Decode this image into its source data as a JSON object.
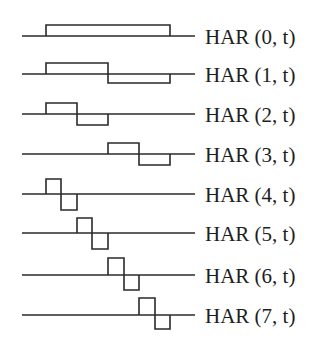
{
  "diagram": {
    "stroke_color": "#2a2a2a",
    "text_color": "#1e1e1e",
    "axis": {
      "x_start": 22,
      "x_end": 195,
      "t0": 46,
      "t1": 170
    },
    "rows": [
      {
        "label": "HAR (0, t)",
        "baseline": 36,
        "amp_up": 11,
        "amp_down": 0,
        "segments": [
          [
            46,
            170,
            1
          ]
        ]
      },
      {
        "label": "HAR (1, t)",
        "baseline": 74,
        "amp_up": 11,
        "amp_down": 9,
        "segments": [
          [
            46,
            108,
            1
          ],
          [
            108,
            170,
            -1
          ]
        ]
      },
      {
        "label": "HAR (2, t)",
        "baseline": 114,
        "amp_up": 11,
        "amp_down": 11,
        "segments": [
          [
            46,
            77,
            1
          ],
          [
            77,
            108,
            -1
          ]
        ]
      },
      {
        "label": "HAR (3, t)",
        "baseline": 154,
        "amp_up": 11,
        "amp_down": 11,
        "segments": [
          [
            108,
            139,
            1
          ],
          [
            139,
            170,
            -1
          ]
        ]
      },
      {
        "label": "HAR (4, t)",
        "baseline": 194,
        "amp_up": 15,
        "amp_down": 16,
        "segments": [
          [
            46,
            61,
            1
          ],
          [
            61,
            77,
            -1
          ]
        ]
      },
      {
        "label": "HAR (5, t)",
        "baseline": 233,
        "amp_up": 15,
        "amp_down": 16,
        "segments": [
          [
            77,
            92,
            1
          ],
          [
            92,
            108,
            -1
          ]
        ]
      },
      {
        "label": "HAR (6, t)",
        "baseline": 275,
        "amp_up": 17,
        "amp_down": 15,
        "segments": [
          [
            108,
            124,
            1
          ],
          [
            124,
            139,
            -1
          ]
        ]
      },
      {
        "label": "HAR (7, t)",
        "baseline": 315,
        "amp_up": 17,
        "amp_down": 14,
        "segments": [
          [
            139,
            155,
            1
          ],
          [
            155,
            170,
            -1
          ]
        ]
      }
    ]
  }
}
